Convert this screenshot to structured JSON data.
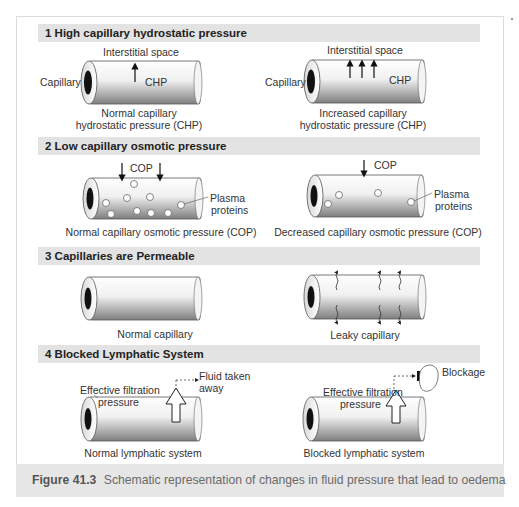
{
  "sections": [
    {
      "number": "1",
      "title": "1  High capillary hydrostatic pressure",
      "left": {
        "top_label": "Interstitial space",
        "side_label": "Capillary",
        "inner_label": "CHP",
        "arrow_count": 1,
        "caption_line1": "Normal capillary",
        "caption_line2": "hydrostatic pressure (CHP)"
      },
      "right": {
        "top_label": "Interstitial space",
        "side_label": "Capillary",
        "inner_label": "CHP",
        "arrow_count": 3,
        "caption_line1": "Increased capillary",
        "caption_line2": "hydrostatic pressure (CHP)"
      }
    },
    {
      "number": "2",
      "title": "2  Low capillary osmotic pressure",
      "left": {
        "top_label": "COP",
        "callout_line1": "Plasma",
        "callout_line2": "proteins",
        "arrow_count": 2,
        "caption": "Normal capillary osmotic pressure (COP)"
      },
      "right": {
        "top_label": "COP",
        "callout_line1": "Plasma",
        "callout_line2": "proteins",
        "arrow_count": 1,
        "caption": "Decreased capillary osmotic pressure (COP)"
      }
    },
    {
      "number": "3",
      "title": "3  Capillaries are Permeable",
      "left": {
        "caption": "Normal capillary"
      },
      "right": {
        "caption": "Leaky capillary",
        "leak_count": 3
      }
    },
    {
      "number": "4",
      "title": "4  Blocked Lymphatic System",
      "left": {
        "label_line1": "Effective filtration",
        "label_line2": "pressure",
        "callout_line1": "Fluid taken",
        "callout_line2": "away",
        "caption": "Normal lymphatic system"
      },
      "right": {
        "label_line1": "Effective filtration",
        "label_line2": "pressure",
        "callout": "Blockage",
        "caption": "Blocked lymphatic system"
      }
    }
  ],
  "figure_caption": {
    "label": "Figure 41.3",
    "text": "Schematic representation of changes in fluid pressure that lead to oedema"
  },
  "colors": {
    "header_bg": "#e3e3e3",
    "caption_bg": "#e6e6e6",
    "vessel_light": "#ffffff",
    "vessel_dark": "#8a8a8a",
    "lumen": "#111111"
  }
}
